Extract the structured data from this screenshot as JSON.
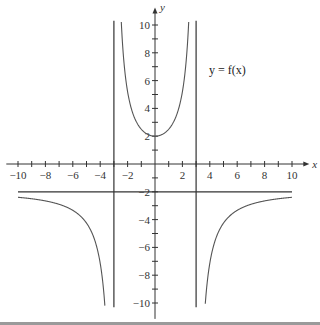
{
  "chart_data": {
    "type": "line",
    "title": "",
    "function_label": "y = f(x)",
    "xlabel": "x",
    "ylabel": "y",
    "xlim": [
      -10,
      10
    ],
    "ylim": [
      -10,
      10
    ],
    "x_ticks": [
      -10,
      -8,
      -6,
      -4,
      -2,
      2,
      4,
      6,
      8,
      10
    ],
    "y_ticks": [
      -10,
      -8,
      -6,
      -4,
      -2,
      2,
      4,
      6,
      8,
      10
    ],
    "grid": false,
    "asymptotes": {
      "vertical": [
        -3,
        3
      ],
      "horizontal": [
        -2
      ]
    },
    "series": [
      {
        "name": "middle branch",
        "x": [
          -2.4,
          -2,
          -1.5,
          -1,
          -0.5,
          0,
          0.5,
          1,
          1.5,
          2,
          2.4
        ],
        "y": [
          10,
          5.2,
          3.4,
          2.5,
          2.1,
          2,
          2.1,
          2.5,
          3.4,
          5.2,
          10
        ]
      },
      {
        "name": "left branch",
        "x": [
          -10,
          -8,
          -6,
          -5,
          -4,
          -3.6,
          -3.4
        ],
        "y": [
          -2.4,
          -2.6,
          -3.2,
          -3.9,
          -5.6,
          -8,
          -10
        ]
      },
      {
        "name": "right branch",
        "x": [
          3.4,
          3.6,
          4,
          5,
          6,
          8,
          10
        ],
        "y": [
          -10,
          -8,
          -5.6,
          -3.9,
          -3.2,
          -2.6,
          -2.4
        ]
      }
    ]
  }
}
